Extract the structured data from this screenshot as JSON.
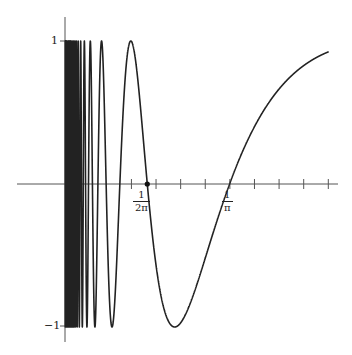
{
  "chart_data": {
    "type": "line",
    "title": "",
    "function": "y = sin(1/x)",
    "xlabel": "",
    "ylabel": "",
    "x_domain": [
      0.0005,
      0.51
    ],
    "xlim": [
      -0.093,
      0.53
    ],
    "ylim": [
      -1.1,
      1.2
    ],
    "grid": false,
    "legend": null,
    "y_ticks": [
      {
        "value": 1,
        "label": "1"
      },
      {
        "value": -1,
        "label": "-1"
      }
    ],
    "x_tick_spacing": 0.0476,
    "x_tick_count": 9,
    "x_tick_start": 0.1285,
    "x_annotations": [
      {
        "value": 0.15915,
        "numerator": "1",
        "denominator": "2π",
        "marked_point": true
      },
      {
        "value": 0.31831,
        "numerator": "1",
        "denominator": "π",
        "marked_point": false
      }
    ],
    "series": [
      {
        "name": "sin(1/x)",
        "color": "#222222"
      }
    ]
  },
  "labels": {
    "y_top": "1",
    "y_bottom": "−1",
    "a1_num": "1",
    "a1_den": "2π",
    "a2_num": "1",
    "a2_den": "π"
  }
}
